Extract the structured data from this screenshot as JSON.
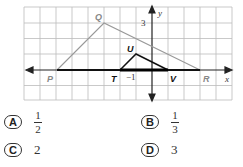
{
  "figure": {
    "axes": {
      "x_label": "x",
      "y_label": "y",
      "tick_labels": {
        "y_3": "3",
        "x_neg1": "−1"
      }
    },
    "points": {
      "P": {
        "label": "P",
        "coord": [
          -6,
          0
        ]
      },
      "Q": {
        "label": "Q",
        "coord": [
          -3,
          3
        ]
      },
      "R": {
        "label": "R",
        "coord": [
          3,
          0
        ]
      },
      "T": {
        "label": "T",
        "coord": [
          -2,
          0
        ]
      },
      "U": {
        "label": "U",
        "coord": [
          -1,
          1
        ]
      },
      "V": {
        "label": "V",
        "coord": [
          1,
          0
        ]
      }
    },
    "colors": {
      "large_triangle": "#999999",
      "small_triangle": "#111111",
      "grid": "#bbbbbb"
    }
  },
  "choices": [
    {
      "letter": "A",
      "numerator": "1",
      "denominator": "2"
    },
    {
      "letter": "B",
      "numerator": "1",
      "denominator": "3"
    },
    {
      "letter": "C",
      "value": "2"
    },
    {
      "letter": "D",
      "value": "3"
    }
  ]
}
